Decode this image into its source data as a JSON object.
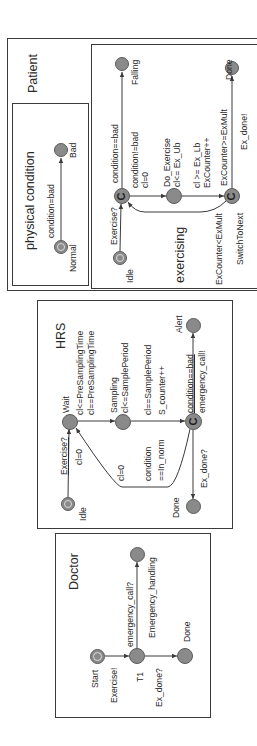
{
  "orientation": "rotated -90deg (text reads bottom-to-top)",
  "patient": {
    "title": "Patient",
    "physical_condition": {
      "title": "physical condition",
      "states": {
        "normal": "Normal",
        "bad": "Bad"
      },
      "edges": {
        "normal_to_bad": "condition=bad"
      }
    },
    "exercising": {
      "title": "exercising",
      "states": {
        "idle": "Idle",
        "falling": "Falling",
        "do_exercise": "Do_Exercise",
        "do_exercise_invariant": "cl<= Ex_Ub",
        "switch_to_next": "SwitchToNext",
        "done": "Done",
        "committed_glyph": "C"
      },
      "edges": {
        "idle_to_choice": "Exercise?",
        "choice_to_falling": "condition==bad",
        "choice_to_do_guard": "condition!=bad",
        "choice_to_do_update": "cl=0",
        "do_to_switch_guard": "cl >= Ex_Lb",
        "do_to_switch_update": "ExCounter++",
        "switch_to_choice": "ExCounter<ExMult",
        "switch_to_done_guard": "ExCounter>=ExMult",
        "switch_to_done_sync": "Ex_done!"
      }
    }
  },
  "hrs": {
    "title": "HRS",
    "states": {
      "idle": "Idle",
      "wait": "Wait",
      "wait_inv1": "cl<=PreSamplingTime",
      "sampling": "Sampling",
      "sampling_inv": "cl<=SamplePeriod",
      "alert": "Alert",
      "done": "Done",
      "committed_glyph": "C"
    },
    "edges": {
      "idle_to_wait_sync": "Exercise?",
      "idle_to_wait_update": "cl=0",
      "wait_to_sampling_guard": "cl==PreSamplingTime",
      "sampling_to_choice_guard": "cl==SamplePeriod",
      "sampling_to_choice_update": "S_counter++",
      "choice_to_alert_guard": "condition==bad",
      "choice_to_alert_sync": "emergency_call!",
      "choice_to_wait_update": "cl=0",
      "choice_to_wait_guard1": "condition",
      "choice_to_wait_guard2": "==In_norm",
      "choice_to_done_sync": "Ex_done?"
    }
  },
  "doctor": {
    "title": "Doctor",
    "states": {
      "start": "Start",
      "t1": "T1",
      "emergency_handling": "Emergency_handling",
      "done": "Done"
    },
    "edges": {
      "start_to_t1": "Exercise!",
      "t1_to_emergency": "emergency_call?",
      "t1_to_done": "Ex_done?"
    }
  },
  "colors": {
    "state_fill": "#8a8a8a",
    "line": "#3a3a3a",
    "background": "#ffffff"
  }
}
